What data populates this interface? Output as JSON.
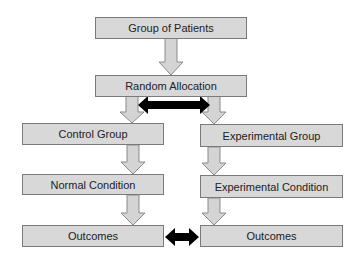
{
  "diagram": {
    "nodes": {
      "group_of_patients": "Group of Patients",
      "random_allocation": "Random Allocation",
      "control_group": "Control Group",
      "experimental_group": "Experimental Group",
      "normal_condition": "Normal Condition",
      "experimental_condition": "Experimental Condition",
      "outcomes_control": "Outcomes",
      "outcomes_experimental": "Outcomes"
    },
    "edges": [
      {
        "from": "group_of_patients",
        "to": "random_allocation",
        "type": "down-arrow"
      },
      {
        "from": "random_allocation",
        "to": "control_group",
        "type": "down-arrow"
      },
      {
        "from": "random_allocation",
        "to": "experimental_group",
        "type": "down-arrow"
      },
      {
        "from": "control_group",
        "to": "normal_condition",
        "type": "down-arrow"
      },
      {
        "from": "normal_condition",
        "to": "outcomes_control",
        "type": "down-arrow"
      },
      {
        "from": "experimental_group",
        "to": "experimental_condition",
        "type": "down-arrow"
      },
      {
        "from": "experimental_condition",
        "to": "outcomes_experimental",
        "type": "down-arrow"
      },
      {
        "from": "control_group",
        "to": "experimental_group",
        "type": "double-arrow-black",
        "note": "comparison between groups"
      },
      {
        "from": "outcomes_control",
        "to": "outcomes_experimental",
        "type": "double-arrow-black",
        "note": "comparison of outcomes"
      }
    ],
    "colors": {
      "box_fill": "#d8d8d8",
      "box_border": "#7a7a7a",
      "arrow_fill": "#d4d4d4",
      "arrow_stroke": "#8a8a8a",
      "compare_arrow": "#000000"
    }
  }
}
